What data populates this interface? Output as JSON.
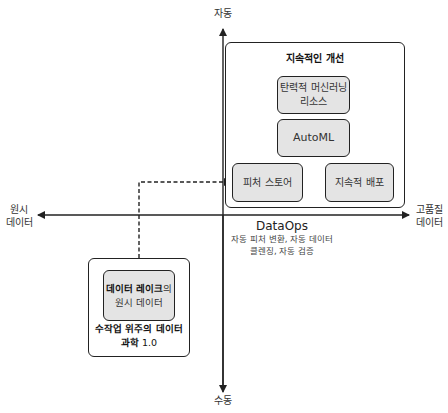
{
  "axes": {
    "top_label": "자동",
    "bottom_label": "수동",
    "left_label": [
      "원시",
      "데이터"
    ],
    "right_label": [
      "고품질",
      "데이터"
    ]
  },
  "upper_group": {
    "title": "지속적인 개선",
    "boxes": {
      "elastic_ml": [
        "탄력적 머신러닝",
        "리소스"
      ],
      "automl": "AutoML",
      "feature_store": "피처 스토어",
      "continuous_deploy": "지속적 배포"
    }
  },
  "dataops": {
    "title": "DataOps",
    "description": [
      "자동 피처 변환, 자동 데이터",
      "클렌징, 자동 검증"
    ]
  },
  "lower_group": {
    "inner_bold": "데이터 레이크",
    "inner_suffix": "의",
    "inner_line2": "원시 데이터",
    "caption_line1": "수작업 위주의 데이터",
    "caption_line2_bold": "과학",
    "caption_line2_rest": " 1.0"
  },
  "colors": {
    "line": "#222222",
    "box_fill": "#e4e4e4",
    "background": "#ffffff"
  }
}
